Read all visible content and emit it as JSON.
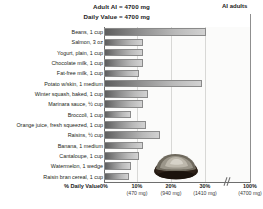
{
  "header": {
    "line1": "Adult AI = 4700 mg",
    "line2": "Daily Value = 4700 mg"
  },
  "reference": {
    "label": "AI adults"
  },
  "axis": {
    "x_title": "% Daily Value",
    "ticks": [
      {
        "pct": "0%",
        "mg": ""
      },
      {
        "pct": "10%",
        "mg": "(470 mg)"
      },
      {
        "pct": "20%",
        "mg": "(940 mg)"
      },
      {
        "pct": "30%",
        "mg": "(1410 mg)"
      },
      {
        "pct": "100%",
        "mg": "(4700 mg)"
      }
    ]
  },
  "decor": {
    "potato_name": "potato-photo"
  },
  "chart_data": {
    "type": "bar",
    "orientation": "horizontal",
    "title": "",
    "subtitle": "Adult AI = 4700 mg / Daily Value = 4700 mg",
    "xlabel": "% Daily Value",
    "ylabel": "",
    "xlim": [
      0,
      30
    ],
    "xticks": [
      0,
      10,
      20,
      30,
      100
    ],
    "xtick_labels": [
      "0%",
      "10% (470 mg)",
      "20% (940 mg)",
      "30% (1410 mg)",
      "100% (4700 mg)"
    ],
    "axis_break": true,
    "grid": true,
    "legend": false,
    "reference_line": {
      "label": "AI adults",
      "value": 100
    },
    "categories": [
      "Beans, 1 cup",
      "Salmon, 3 oz",
      "Yogurt, plain, 1 cup",
      "Chocolate milk, 1 cup",
      "Fat-free milk, 1 cup",
      "Potato w/skin, 1 medium",
      "Winter squash, baked, 1 cup",
      "Marinara sauce, ½ cup",
      "Broccoli, 1 cup",
      "Orange juice, fresh squeezed, 1 cup",
      "Raisins, ½ cup",
      "Banana, 1 medium",
      "Cantaloupe, 1 cup",
      "Watermelon, 1 wedge",
      "Raisin bran cereal, 1 cup"
    ],
    "values": [
      24.5,
      9.5,
      9.5,
      9.5,
      8.5,
      23.5,
      10.5,
      9.5,
      6.5,
      10.0,
      13.5,
      9.5,
      8.5,
      6.5,
      6.0
    ],
    "value_unit": "% Daily Value"
  }
}
